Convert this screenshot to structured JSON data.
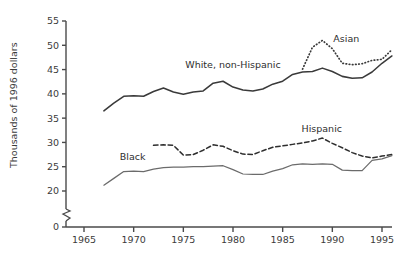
{
  "chart_data": {
    "type": "line",
    "title": "",
    "xlabel": "",
    "ylabel": "Thousands of 1996 dollars",
    "xlim": [
      1964,
      1996.8
    ],
    "ylim": [
      0,
      55
    ],
    "y_axis_break": true,
    "y_break_between": [
      0,
      20
    ],
    "grid": false,
    "legend_position": "inline-annotations",
    "xticks": [
      "1965",
      "1970",
      "1975",
      "1980",
      "1985",
      "1990",
      "1995"
    ],
    "xtick_values": [
      1965,
      1970,
      1975,
      1980,
      1985,
      1990,
      1995
    ],
    "yticks": [
      "0",
      "20",
      "25",
      "30",
      "35",
      "40",
      "45",
      "50",
      "55"
    ],
    "ytick_values": [
      0,
      20,
      25,
      30,
      35,
      40,
      45,
      50,
      55
    ],
    "series": [
      {
        "name": "White, non-Hispanic",
        "style": "solid",
        "color": "#3a3a3a",
        "label_x": 1975.2,
        "label_y": 45.3,
        "x": [
          1967,
          1968,
          1969,
          1970,
          1971,
          1972,
          1973,
          1974,
          1975,
          1976,
          1977,
          1978,
          1979,
          1980,
          1981,
          1982,
          1983,
          1984,
          1985,
          1986,
          1987,
          1988,
          1989,
          1990,
          1991,
          1992,
          1993,
          1994,
          1995,
          1996
        ],
        "y": [
          36.5,
          38.1,
          39.5,
          39.6,
          39.5,
          40.5,
          41.2,
          40.4,
          39.9,
          40.4,
          40.6,
          42.2,
          42.6,
          41.4,
          40.8,
          40.6,
          41.0,
          42.0,
          42.6,
          44.0,
          44.5,
          44.6,
          45.3,
          44.6,
          43.6,
          43.2,
          43.3,
          44.5,
          46.3,
          47.8
        ]
      },
      {
        "name": "Asian",
        "style": "dotted",
        "color": "#3a3a3a",
        "label_x": 1990.1,
        "label_y": 50.6,
        "x": [
          1987,
          1988,
          1989,
          1990,
          1991,
          1992,
          1993,
          1994,
          1995,
          1996
        ],
        "y": [
          45.1,
          49.6,
          51.0,
          49.3,
          46.3,
          46.0,
          46.2,
          46.9,
          47.1,
          49.1
        ]
      },
      {
        "name": "Hispanic",
        "style": "dashed",
        "color": "#2e2e2e",
        "label_x": 1986.9,
        "label_y": 32.2,
        "x": [
          1972,
          1973,
          1974,
          1975,
          1976,
          1977,
          1978,
          1979,
          1980,
          1981,
          1982,
          1983,
          1984,
          1985,
          1986,
          1987,
          1988,
          1989,
          1990,
          1991,
          1992,
          1993,
          1994,
          1995,
          1996
        ],
        "y": [
          29.4,
          29.5,
          29.4,
          27.4,
          27.5,
          28.4,
          29.5,
          29.2,
          28.3,
          27.6,
          27.5,
          28.3,
          29.0,
          29.3,
          29.6,
          29.9,
          30.3,
          30.9,
          29.8,
          28.9,
          27.9,
          27.2,
          26.8,
          27.2,
          27.5
        ]
      },
      {
        "name": "Black",
        "style": "solid-thin",
        "color": "#6b6b6b",
        "label_x": 1968.6,
        "label_y": 26.4,
        "x": [
          1967,
          1968,
          1969,
          1970,
          1971,
          1972,
          1973,
          1974,
          1975,
          1976,
          1977,
          1978,
          1979,
          1980,
          1981,
          1982,
          1983,
          1984,
          1985,
          1986,
          1987,
          1988,
          1989,
          1990,
          1991,
          1992,
          1993,
          1994,
          1995,
          1996
        ],
        "y": [
          21.2,
          22.6,
          24.0,
          24.1,
          24.0,
          24.5,
          24.8,
          24.9,
          24.9,
          25.0,
          25.0,
          25.1,
          25.2,
          24.4,
          23.5,
          23.4,
          23.4,
          24.1,
          24.6,
          25.4,
          25.6,
          25.5,
          25.6,
          25.5,
          24.3,
          24.2,
          24.2,
          26.3,
          26.6,
          27.3
        ]
      }
    ]
  },
  "axis": {
    "ylabel_text": "Thousands of 1996 dollars"
  }
}
